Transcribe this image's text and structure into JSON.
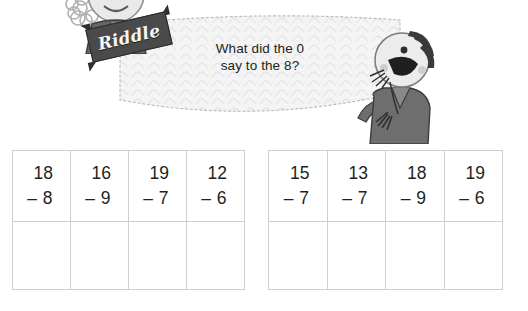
{
  "page": {
    "background_color": "#ffffff",
    "text_color": "#231f20"
  },
  "riddle": {
    "sign_label": "Riddle",
    "question_line1": "What did the 0",
    "question_line2": "say to the 8?",
    "banner_fill": "#f4f4f4",
    "sign_color": "#4a4a4a"
  },
  "characters": [
    {
      "name": "character-left-holding-sign",
      "description": "curly-haired kid holding Riddle sign"
    },
    {
      "name": "character-right-laughing",
      "description": "laughing kid with hand on hip"
    }
  ],
  "worksheet": {
    "tables": [
      {
        "name": "left-table",
        "columns": [
          {
            "minuend": "18",
            "subtrahend": "– 8",
            "answer": ""
          },
          {
            "minuend": "16",
            "subtrahend": "– 9",
            "answer": ""
          },
          {
            "minuend": "19",
            "subtrahend": "– 7",
            "answer": ""
          },
          {
            "minuend": "12",
            "subtrahend": "– 6",
            "answer": ""
          }
        ]
      },
      {
        "name": "right-table",
        "columns": [
          {
            "minuend": "15",
            "subtrahend": "– 7",
            "answer": ""
          },
          {
            "minuend": "13",
            "subtrahend": "– 7",
            "answer": ""
          },
          {
            "minuend": "18",
            "subtrahend": "– 9",
            "answer": ""
          },
          {
            "minuend": "19",
            "subtrahend": "– 6",
            "answer": ""
          }
        ]
      }
    ],
    "border_color": "#cfcfcf"
  }
}
